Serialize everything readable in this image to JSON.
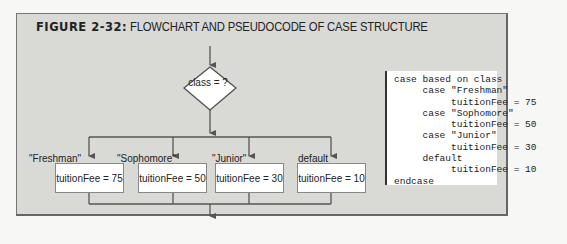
{
  "figure": {
    "label": "FIGURE 2-32:",
    "caption": "FLOWCHART AND PSEUDOCODE OF CASE STRUCTURE"
  },
  "flowchart": {
    "decision": "class = ?",
    "branches": [
      {
        "label": "\"Freshman\"",
        "action": "tuitionFee = 75"
      },
      {
        "label": "\"Sophomore\"",
        "action": "tuitionFee = 50"
      },
      {
        "label": "\"Junior\"",
        "action": "tuitionFee = 30"
      },
      {
        "label": "default",
        "action": "tuitionFee = 10"
      }
    ]
  },
  "pseudocode": {
    "lines": [
      "case based on class",
      "     case \"Freshman\"",
      "          tuitionFee = 75",
      "     case \"Sophomore\"",
      "          tuitionFee = 50",
      "     case \"Junior\"",
      "          tuitionFee = 30",
      "     default",
      "          tuitionFee = 10",
      "endcase"
    ]
  },
  "colors": {
    "panel_bg": "#d9d9d6",
    "line": "#555555",
    "box_bg": "#ffffff"
  }
}
